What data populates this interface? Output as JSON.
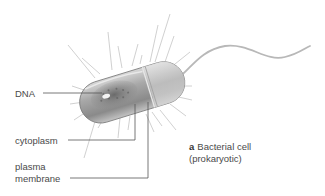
{
  "figure": {
    "caption_letter": "a",
    "caption_title": "Bacterial cell",
    "caption_subtitle": "(prokaryotic)",
    "labels": {
      "dna": "DNA",
      "cytoplasm": "cytoplasm",
      "plasma_line1": "plasma",
      "plasma_line2": "membrane"
    }
  },
  "colors": {
    "background": "#ffffff",
    "label_text": "#4a4a4a",
    "leader_line": "#555555",
    "cell_body": "#9a9a9a",
    "pili": "#bdbdbd"
  }
}
